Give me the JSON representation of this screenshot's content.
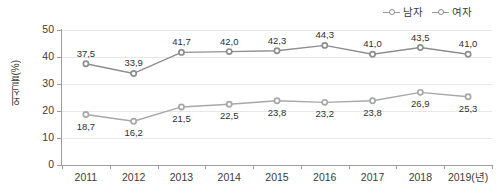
{
  "legend": {
    "position": "top-right",
    "items": [
      {
        "label": "남자",
        "color": "#8e8e8e",
        "marker": "circle-outline"
      },
      {
        "label": "여자",
        "color": "#a8a8a8",
        "marker": "circle-outline"
      }
    ]
  },
  "axes": {
    "y_title": "외식률(%)",
    "y_ticks": [
      "0",
      "10",
      "20",
      "30",
      "40",
      "50"
    ],
    "x_ticks": [
      "2011",
      "2012",
      "2013",
      "2014",
      "2015",
      "2016",
      "2017",
      "2018",
      "2019(년)"
    ]
  },
  "chart_data": {
    "type": "line",
    "title": "",
    "subtitle": "",
    "xlabel": "",
    "ylabel": "외식률(%)",
    "categories": [
      "2011",
      "2012",
      "2013",
      "2014",
      "2015",
      "2016",
      "2017",
      "2018",
      "2019(년)"
    ],
    "ylim": [
      0,
      50
    ],
    "yticks": [
      0,
      10,
      20,
      30,
      40,
      50
    ],
    "grid": true,
    "legend_position": "top-right",
    "series": [
      {
        "name": "남자",
        "color": "#8e8e8e",
        "label_position": "above",
        "values": [
          37.5,
          33.9,
          41.7,
          42.0,
          42.3,
          44.3,
          41.0,
          43.5,
          41.0
        ],
        "labels": [
          "37,5",
          "33,9",
          "41,7",
          "42,0",
          "42,3",
          "44,3",
          "41,0",
          "43,5",
          "41,0"
        ]
      },
      {
        "name": "여자",
        "color": "#a8a8a8",
        "label_position": "below",
        "values": [
          18.7,
          16.2,
          21.5,
          22.5,
          23.8,
          23.2,
          23.8,
          26.9,
          25.3
        ],
        "labels": [
          "18,7",
          "16,2",
          "21,5",
          "22,5",
          "23,8",
          "23,2",
          "23,8",
          "26,9",
          "25,3"
        ]
      }
    ]
  }
}
